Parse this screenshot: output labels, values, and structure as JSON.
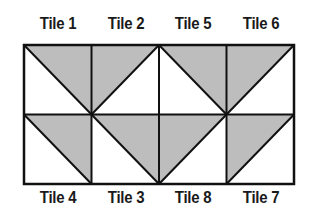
{
  "diagram": {
    "title": "",
    "fill_color": "#bdbdbd",
    "line_color": "#111111",
    "grid": {
      "left": 24,
      "top": 45,
      "width": 270,
      "height": 139,
      "cols": 4,
      "rows": 2
    },
    "rows": [
      {
        "position": "top",
        "tiles": [
          {
            "label": "Tile 1",
            "diagonal": "tl-br",
            "shaded": "top-right"
          },
          {
            "label": "Tile 2",
            "diagonal": "bl-tr",
            "shaded": "top-left"
          },
          {
            "label": "Tile 5",
            "diagonal": "tl-br",
            "shaded": "top-right"
          },
          {
            "label": "Tile 6",
            "diagonal": "bl-tr",
            "shaded": "top-left"
          }
        ]
      },
      {
        "position": "bottom",
        "tiles": [
          {
            "label": "Tile 4",
            "diagonal": "tl-br",
            "shaded": "top-right"
          },
          {
            "label": "Tile 3",
            "diagonal": "tl-br",
            "shaded": "top-right"
          },
          {
            "label": "Tile 8",
            "diagonal": "bl-tr",
            "shaded": "top-left"
          },
          {
            "label": "Tile 7",
            "diagonal": "bl-tr",
            "shaded": "top-left"
          }
        ]
      }
    ]
  }
}
